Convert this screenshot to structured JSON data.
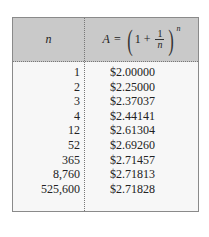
{
  "table": {
    "header": {
      "col_n": "n",
      "col_formula": {
        "lhs": "A",
        "eq": "=",
        "one": "1",
        "plus": "+",
        "frac_num": "1",
        "frac_den": "n",
        "exponent": "n"
      }
    },
    "rows": [
      {
        "n": "1",
        "a": "$2.00000"
      },
      {
        "n": "2",
        "a": "$2.25000"
      },
      {
        "n": "3",
        "a": "$2.37037"
      },
      {
        "n": "4",
        "a": "$2.44141"
      },
      {
        "n": "12",
        "a": "$2.61304"
      },
      {
        "n": "52",
        "a": "$2.69260"
      },
      {
        "n": "365",
        "a": "$2.71457"
      },
      {
        "n": "8,760",
        "a": "$2.71813"
      },
      {
        "n": "525,600",
        "a": "$2.71828"
      }
    ]
  },
  "colors": {
    "header_bg": "#c9c9c9",
    "body_bg": "#f7f7f7",
    "border": "#8a8a8a"
  }
}
